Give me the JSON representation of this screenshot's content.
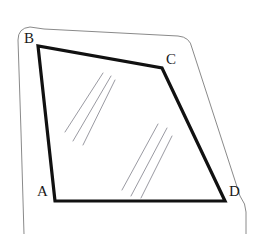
{
  "figure": {
    "title": "",
    "type": "geometry-diagram",
    "colors": {
      "background": "#ffffff",
      "quad_stroke": "#111111",
      "frame_stroke": "#8a8a8a",
      "reflection_stroke": "#9a9aa2",
      "label_text": "#1a1a1a",
      "watermark_text": "#fdfdfd"
    },
    "stroke_widths": {
      "quad": 3.2,
      "frame": 1.0,
      "reflection": 1.0
    },
    "labels": [
      {
        "id": "A",
        "text": "A",
        "x": 37,
        "y": 184
      },
      {
        "id": "B",
        "text": "B",
        "x": 24,
        "y": 31
      },
      {
        "id": "C",
        "text": "C",
        "x": 166,
        "y": 52
      },
      {
        "id": "D",
        "text": "D",
        "x": 229,
        "y": 184
      }
    ],
    "quadrilateral": {
      "name": "ABCD",
      "vertices": [
        {
          "id": "A",
          "x": 55,
          "y": 201
        },
        {
          "id": "B",
          "x": 38,
          "y": 46
        },
        {
          "id": "C",
          "x": 162,
          "y": 68
        },
        {
          "id": "D",
          "x": 225,
          "y": 201
        }
      ],
      "path": "M 55 201 L 38 46 L 162 68 L 225 201 Z"
    },
    "frame": {
      "name": "window-frame-outline",
      "path": "M 24 234 L 21 132 L 18 40 Q 18 28 30 27 L 44 29 L 178 36 Q 190 37 192 48 L 240 196 Q 246 204 246 212 L 246 234"
    },
    "reflections": {
      "group_one": [
        {
          "x1": 65,
          "y1": 132,
          "x2": 103,
          "y2": 73
        },
        {
          "x1": 73,
          "y1": 141,
          "x2": 111,
          "y2": 76
        },
        {
          "x1": 83,
          "y1": 145,
          "x2": 115,
          "y2": 80
        }
      ],
      "group_two": [
        {
          "x1": 122,
          "y1": 190,
          "x2": 158,
          "y2": 124
        },
        {
          "x1": 131,
          "y1": 196,
          "x2": 167,
          "y2": 128
        },
        {
          "x1": 141,
          "y1": 198,
          "x2": 172,
          "y2": 136
        }
      ]
    },
    "watermark": {
      "text": "",
      "visible": false
    }
  }
}
